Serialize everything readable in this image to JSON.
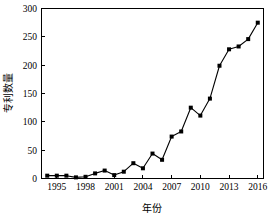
{
  "chart_data": {
    "type": "line",
    "title": "",
    "xlabel": "年份",
    "ylabel": "专利数量",
    "xlim": [
      1993.4,
      2016.6
    ],
    "ylim": [
      0,
      300
    ],
    "grid": false,
    "legend": false,
    "marker": "square",
    "line_color": "#000000",
    "marker_color": "#000000",
    "xticks": [
      1995,
      1998,
      2001,
      2004,
      2007,
      2010,
      2013,
      2016
    ],
    "xtick_labels": [
      "1995",
      "1998",
      "2001",
      "2004",
      "2007",
      "2010",
      "2013",
      "2016"
    ],
    "yticks": [
      0,
      50,
      100,
      150,
      200,
      250,
      300
    ],
    "ytick_labels": [
      "0",
      "50",
      "100",
      "150",
      "200",
      "250",
      "300"
    ],
    "x": [
      1994,
      1995,
      1996,
      1997,
      1998,
      1999,
      2000,
      2001,
      2002,
      2003,
      2004,
      2005,
      2006,
      2007,
      2008,
      2009,
      2010,
      2011,
      2012,
      2013,
      2014,
      2015,
      2016
    ],
    "values": [
      5,
      5,
      5,
      2,
      3,
      9,
      14,
      6,
      12,
      27,
      18,
      44,
      33,
      74,
      83,
      125,
      111,
      141,
      199,
      228,
      233,
      246,
      275
    ],
    "series": [
      {
        "name": "专利数量",
        "values": [
          5,
          5,
          5,
          2,
          3,
          9,
          14,
          6,
          12,
          27,
          18,
          44,
          33,
          74,
          83,
          125,
          111,
          141,
          199,
          228,
          233,
          246,
          275
        ]
      }
    ]
  }
}
